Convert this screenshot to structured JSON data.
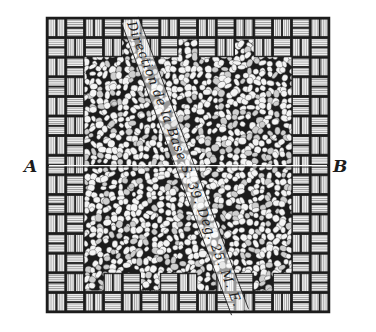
{
  "figure": {
    "type": "engraving",
    "labels": {
      "left_point": "A",
      "right_point": "B"
    },
    "baseline_text": "Direction de la Base S. 39. Deg. 25. M. E.",
    "colors": {
      "ink": "#1c1c1c",
      "paper": "#ffffff",
      "brick_fill": "#e9e9e9",
      "stone_fill": "#f4f4f4"
    },
    "geometry": {
      "frame": {
        "x": 47,
        "y": 18,
        "w": 282,
        "h": 294
      },
      "ab_line_y": 167,
      "diagonal": {
        "x1": 130,
        "y1": 20,
        "x2": 240,
        "y2": 312
      }
    }
  }
}
